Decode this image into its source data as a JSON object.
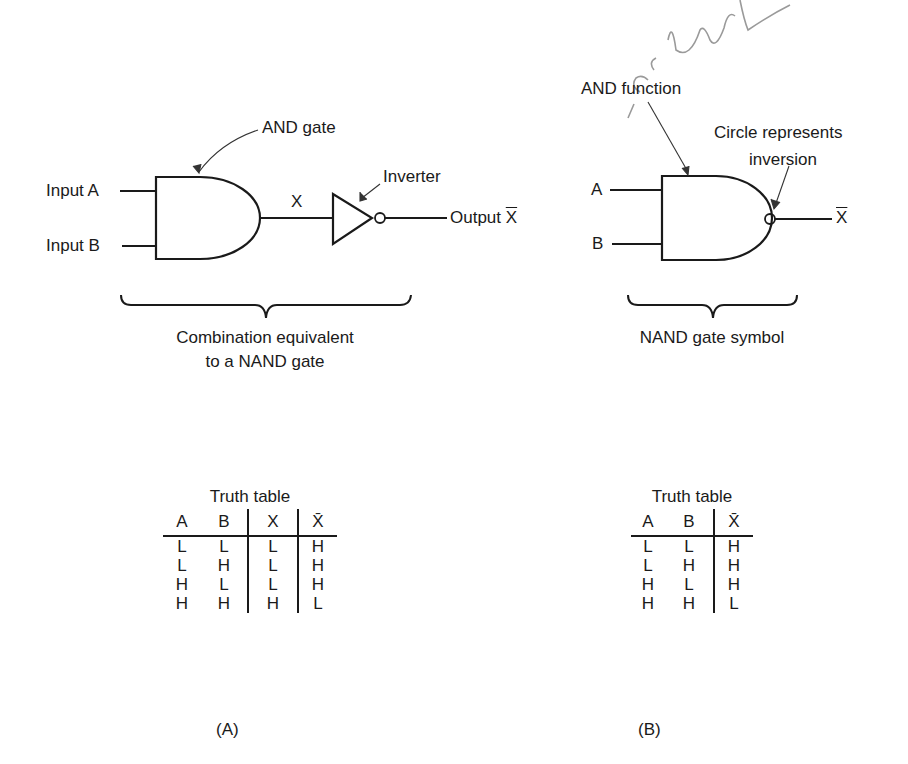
{
  "panel_a": {
    "label": "(A)",
    "inputs": [
      "Input A",
      "Input B"
    ],
    "and_gate_label": "AND gate",
    "intermediate_label": "X",
    "inverter_label": "Inverter",
    "output_label_prefix": "Output ",
    "output_symbol": "X",
    "caption_line1": "Combination equivalent",
    "caption_line2": "to a NAND gate",
    "truth_table": {
      "title": "Truth table",
      "headers": [
        "A",
        "B",
        "X",
        "X̄"
      ],
      "rows": [
        [
          "L",
          "L",
          "L",
          "H"
        ],
        [
          "L",
          "H",
          "L",
          "H"
        ],
        [
          "H",
          "L",
          "L",
          "H"
        ],
        [
          "H",
          "H",
          "H",
          "L"
        ]
      ]
    }
  },
  "panel_b": {
    "label": "(B)",
    "inputs": [
      "A",
      "B"
    ],
    "and_function_label": "AND function",
    "circle_label_line1": "Circle represents",
    "circle_label_line2": "inversion",
    "output_symbol": "X",
    "caption": "NAND gate symbol",
    "truth_table": {
      "title": "Truth table",
      "headers": [
        "A",
        "B",
        "X̄"
      ],
      "rows": [
        [
          "L",
          "L",
          "H"
        ],
        [
          "L",
          "H",
          "H"
        ],
        [
          "H",
          "L",
          "H"
        ],
        [
          "H",
          "H",
          "L"
        ]
      ]
    }
  },
  "annotation": {
    "handwritten": "or bul"
  }
}
